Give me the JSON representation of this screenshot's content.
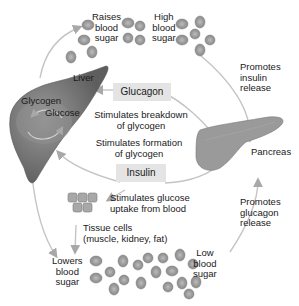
{
  "diagram": {
    "organs": {
      "liver": "Liver",
      "pancreas": "Pancreas",
      "tissue": {
        "line1": "Tissue cells",
        "line2": "(muscle, kidney, fat)"
      }
    },
    "liver_inner": {
      "glycogen": "Glycogen",
      "glucose": "Glucose"
    },
    "hormones": {
      "glucagon": "Glucagon",
      "insulin": "Insulin"
    },
    "effects": {
      "breakdown": {
        "line1": "Stimulates breakdown",
        "line2": "of glycogen"
      },
      "formation": {
        "line1": "Stimulates formation",
        "line2": "of glycogen"
      },
      "uptake": {
        "line1": "Stimulates glucose",
        "line2": "uptake from blood"
      }
    },
    "states": {
      "raises": {
        "line1": "Raises",
        "line2": "blood",
        "line3": "sugar"
      },
      "high": {
        "line1": "High",
        "line2": "blood",
        "line3": "sugar"
      },
      "lowers": {
        "line1": "Lowers",
        "line2": "blood",
        "line3": "sugar"
      },
      "low": {
        "line1": "Low",
        "line2": "blood",
        "line3": "sugar"
      }
    },
    "pancreas_actions": {
      "insulin_release": {
        "line1": "Promotes",
        "line2": "insulin",
        "line3": "release"
      },
      "glucagon_release": {
        "line1": "Promotes",
        "line2": "glucagon",
        "line3": "release"
      }
    },
    "colors": {
      "liver": "#6e6e6e",
      "liver_light": "#8c8c8c",
      "pancreas": "#9a9a9a",
      "blood_cell": "#9b9b9b",
      "blood_cell_center": "#b8b8b8",
      "hormone_box": "#e4e4e4",
      "arrow": "#bdbdbd"
    }
  }
}
